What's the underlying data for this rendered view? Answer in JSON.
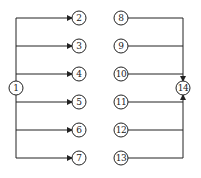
{
  "diagram": {
    "type": "flow-network",
    "colors": {
      "stroke": "#222222",
      "background": "#ffffff"
    },
    "nodes": [
      {
        "id": "1",
        "label": "1",
        "x": 16,
        "y": 88
      },
      {
        "id": "2",
        "label": "2",
        "x": 79,
        "y": 18
      },
      {
        "id": "3",
        "label": "3",
        "x": 79,
        "y": 46
      },
      {
        "id": "4",
        "label": "4",
        "x": 79,
        "y": 74
      },
      {
        "id": "5",
        "label": "5",
        "x": 79,
        "y": 102
      },
      {
        "id": "6",
        "label": "6",
        "x": 79,
        "y": 130
      },
      {
        "id": "7",
        "label": "7",
        "x": 79,
        "y": 158
      },
      {
        "id": "8",
        "label": "8",
        "x": 121,
        "y": 18
      },
      {
        "id": "9",
        "label": "9",
        "x": 121,
        "y": 46
      },
      {
        "id": "10",
        "label": "10",
        "x": 121,
        "y": 74
      },
      {
        "id": "11",
        "label": "11",
        "x": 121,
        "y": 102
      },
      {
        "id": "12",
        "label": "12",
        "x": 121,
        "y": 130
      },
      {
        "id": "13",
        "label": "13",
        "x": 121,
        "y": 158
      },
      {
        "id": "14",
        "label": "14",
        "x": 183,
        "y": 88
      }
    ],
    "edges": [
      {
        "from": "1",
        "to": "2"
      },
      {
        "from": "1",
        "to": "3"
      },
      {
        "from": "1",
        "to": "4"
      },
      {
        "from": "1",
        "to": "5"
      },
      {
        "from": "1",
        "to": "6"
      },
      {
        "from": "1",
        "to": "7"
      },
      {
        "from": "8",
        "to": "14"
      },
      {
        "from": "9",
        "to": "14"
      },
      {
        "from": "10",
        "to": "14"
      },
      {
        "from": "11",
        "to": "14"
      },
      {
        "from": "12",
        "to": "14"
      },
      {
        "from": "13",
        "to": "14"
      }
    ]
  }
}
